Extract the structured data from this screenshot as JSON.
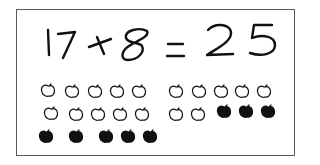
{
  "equation": {
    "text": "17+8=25",
    "addend_1": "17",
    "operator": "+",
    "addend_2": "8",
    "equals": "=",
    "sum": "25"
  },
  "colors": {
    "ink": "#111111",
    "border": "#5a5a5a",
    "background": "#ffffff"
  },
  "apples": {
    "outline_count": 17,
    "filled_count": 8,
    "total": 25,
    "items": [
      {
        "x": 40,
        "y": 83,
        "type": "outline"
      },
      {
        "x": 64,
        "y": 84,
        "type": "outline"
      },
      {
        "x": 87,
        "y": 84,
        "type": "outline"
      },
      {
        "x": 109,
        "y": 84,
        "type": "outline"
      },
      {
        "x": 131,
        "y": 84,
        "type": "outline"
      },
      {
        "x": 168,
        "y": 84,
        "type": "outline"
      },
      {
        "x": 191,
        "y": 84,
        "type": "outline"
      },
      {
        "x": 213,
        "y": 84,
        "type": "outline"
      },
      {
        "x": 234,
        "y": 84,
        "type": "outline"
      },
      {
        "x": 256,
        "y": 84,
        "type": "outline"
      },
      {
        "x": 43,
        "y": 106,
        "type": "outline"
      },
      {
        "x": 68,
        "y": 107,
        "type": "outline"
      },
      {
        "x": 90,
        "y": 107,
        "type": "outline"
      },
      {
        "x": 112,
        "y": 107,
        "type": "outline"
      },
      {
        "x": 134,
        "y": 107,
        "type": "outline"
      },
      {
        "x": 168,
        "y": 107,
        "type": "filled_skip"
      },
      {
        "x": 168,
        "y": 107,
        "type": "outline"
      },
      {
        "x": 190,
        "y": 107,
        "type": "outline"
      },
      {
        "x": 216,
        "y": 104,
        "type": "filled"
      },
      {
        "x": 238,
        "y": 104,
        "type": "filled"
      },
      {
        "x": 260,
        "y": 104,
        "type": "filled"
      },
      {
        "x": 38,
        "y": 129,
        "type": "filled"
      },
      {
        "x": 68,
        "y": 129,
        "type": "filled"
      },
      {
        "x": 98,
        "y": 129,
        "type": "filled"
      },
      {
        "x": 120,
        "y": 129,
        "type": "filled"
      },
      {
        "x": 142,
        "y": 129,
        "type": "filled"
      }
    ]
  }
}
